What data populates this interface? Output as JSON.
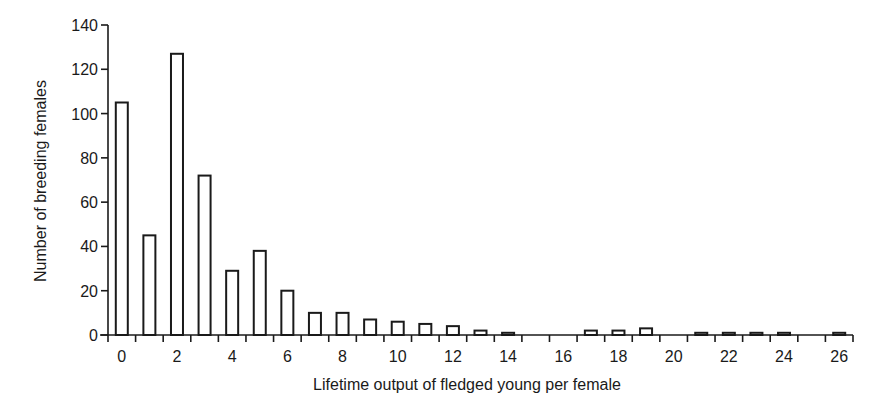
{
  "chart_data": {
    "type": "bar",
    "title": "",
    "xlabel": "Lifetime output of fledged young per female",
    "ylabel": "Number of breeding females",
    "categories": [
      0,
      1,
      2,
      3,
      4,
      5,
      6,
      7,
      8,
      9,
      10,
      11,
      12,
      13,
      14,
      15,
      16,
      17,
      18,
      19,
      20,
      21,
      22,
      23,
      24,
      25,
      26
    ],
    "values": [
      105,
      45,
      127,
      72,
      29,
      38,
      20,
      10,
      10,
      7,
      6,
      5,
      4,
      2,
      1,
      0,
      0,
      2,
      2,
      3,
      0,
      1,
      1,
      1,
      1,
      0,
      1
    ],
    "xticks": [
      0,
      2,
      4,
      6,
      8,
      10,
      12,
      14,
      16,
      18,
      20,
      22,
      24,
      26
    ],
    "yticks": [
      0,
      20,
      40,
      60,
      80,
      100,
      120,
      140
    ],
    "ylim": [
      0,
      140
    ],
    "xlim": [
      -0.5,
      26.5
    ],
    "grid": false,
    "legend": null,
    "bar_fill": "#ffffff",
    "bar_stroke": "#1a1a1a"
  }
}
